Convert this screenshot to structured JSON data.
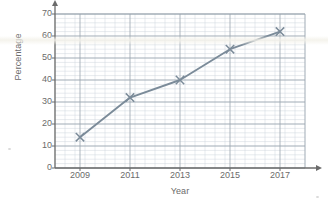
{
  "chart_data": {
    "type": "line",
    "title": "",
    "xlabel": "Year",
    "ylabel": "Percentage",
    "x": [
      2009,
      2011,
      2013,
      2015,
      2017
    ],
    "values": [
      14,
      32,
      40,
      54,
      62
    ],
    "series": [
      {
        "name": "Percentage",
        "values": [
          14,
          32,
          40,
          54,
          62
        ]
      }
    ],
    "categories": [
      "2009",
      "2011",
      "2013",
      "2015",
      "2017"
    ],
    "xtick_labels": [
      "2009",
      "2011",
      "2013",
      "2015",
      "2017"
    ],
    "ytick_labels": [
      "0",
      "10",
      "20",
      "30",
      "40",
      "50",
      "60",
      "70"
    ],
    "ytick_values": [
      0,
      10,
      20,
      30,
      40,
      50,
      60,
      70
    ],
    "xlim": [
      2008,
      2018
    ],
    "ylim": [
      0,
      70
    ],
    "grid": true,
    "grid_minor": true,
    "legend": false,
    "marker": "x",
    "line_color": "#7b8b99",
    "marker_color": "#7b8b99",
    "grid_major_color": "#9aa4ae",
    "grid_minor_color": "#cfd6dc",
    "axis_color": "#6b6b6b",
    "text_color": "#6b6b6b",
    "background": "#ffffff"
  },
  "axes": {
    "y_title": "Percentage",
    "x_title": "Year"
  }
}
